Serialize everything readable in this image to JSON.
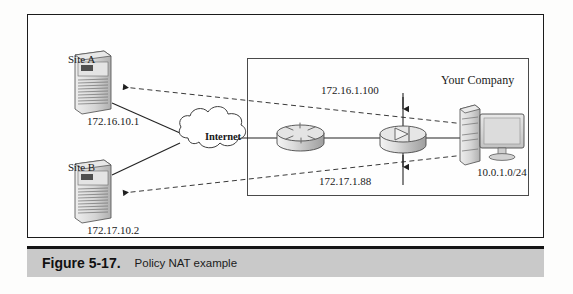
{
  "figure": {
    "caption_number": "Figure 5-17.",
    "caption_text": "Policy NAT example",
    "type": "network-topology-diagram"
  },
  "diagram": {
    "sites": [
      {
        "name": "site-a",
        "label": "Site A",
        "device": "server-tower",
        "ip": "172.16.10.1",
        "translated_ip": "172.16.1.100"
      },
      {
        "name": "site-b",
        "label": "Site B",
        "device": "server-tower",
        "ip": "172.17.10.2",
        "translated_ip": "172.17.1.88"
      }
    ],
    "cloud": {
      "label": "Internet"
    },
    "router": {
      "label": "",
      "device": "cisco-router"
    },
    "firewall": {
      "label": "",
      "device": "pix-firewall"
    },
    "company": {
      "label": "Your Company",
      "device": "desktop-computer",
      "network": "10.0.1.0/24"
    },
    "nat_mappings": [
      {
        "real": "172.16.10.1",
        "mapped": "172.16.1.100"
      },
      {
        "real": "172.17.10.2",
        "mapped": "172.17.1.88"
      }
    ]
  },
  "colors": {
    "frame_border": "#1b1b1b",
    "inner_border": "#4a4a4a",
    "caption_background": "#c9c9c9",
    "line": "#2a2a2a",
    "device_fill": "#d8d8d8"
  }
}
